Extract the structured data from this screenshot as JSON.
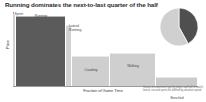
{
  "title": "Running dominates the next-to-last quarter of the half",
  "chart_data": {
    "type": "bar",
    "title": "Running dominates the next-to-last quarter of the half",
    "xlabel": "Fraction of Game Time",
    "ylabel": "Pace",
    "grid": false,
    "legend": "none",
    "categories": [
      "Sprint",
      "Running",
      "Lateral Running",
      "Crawling",
      "Walking",
      "Benched"
    ],
    "values": [
      97,
      94,
      83,
      40,
      44,
      12
    ],
    "widths": [
      3,
      50,
      6,
      38,
      46,
      30
    ],
    "ylim": [
      0,
      100
    ],
    "xlim": [
      0,
      100
    ],
    "annotations": [
      {
        "label": "Sprint",
        "value": 97
      },
      {
        "label": "Running",
        "value": 94
      },
      {
        "label": "Lateral\nRunning",
        "value": 83
      },
      {
        "label": "Crawling",
        "value": 40
      },
      {
        "label": "Walking",
        "value": 44
      },
      {
        "label": "Benched",
        "value": 12
      }
    ],
    "colors": {
      "highlight": "#5b5b5b",
      "muted": "#c9c9c9",
      "axis": "#9a9a9a",
      "text": "#3d3d3d"
    }
  },
  "bars": [
    {
      "name": "sprint",
      "label": "Sprint",
      "x": 0.0,
      "w": 3.0,
      "h": 97,
      "color": "#d2d2d2",
      "label_x": 1.5,
      "label_y": 0,
      "label_w": 14,
      "label_align": "left"
    },
    {
      "name": "running",
      "label": "Running",
      "x": 3.0,
      "w": 50.0,
      "h": 94,
      "color": "#5b5b5b",
      "label_x": 28,
      "label_y": 1.5,
      "label_w": 26,
      "label_align": "center"
    },
    {
      "name": "lateral-running",
      "label": "Lateral\nRunning",
      "x": 53.0,
      "w": 6.0,
      "h": 83,
      "color": "#d2d2d2",
      "label_x": 56,
      "label_y": 12,
      "label_w": 16,
      "label_align": "left"
    },
    {
      "name": "crawling",
      "label": "Crawling",
      "x": 59.0,
      "w": 38.0,
      "h": 40,
      "color": "#cfcfcf",
      "label_x": 78,
      "label_y": 56,
      "label_w": 24,
      "label_align": "center"
    },
    {
      "name": "walking",
      "label": "Walking",
      "x": 97.0,
      "w": 46.0,
      "h": 44,
      "color": "#cfcfcf",
      "label_x": 120,
      "label_y": 52,
      "label_w": 24,
      "label_align": "center"
    },
    {
      "name": "benched",
      "label": "Benched",
      "x": 143.0,
      "w": 42.0,
      "h": 12,
      "color": "#cbcbcb",
      "label_x": 164,
      "label_y": 84,
      "label_w": 24,
      "label_align": "center"
    }
  ],
  "axes": {
    "x_title": "Fraction of Game Time",
    "y_title": "Pace"
  },
  "pie": {
    "name": "movement-share-pie",
    "slices": [
      {
        "name": "active",
        "value": 42,
        "color": "#4f4f4f"
      },
      {
        "name": "inactive",
        "value": 58,
        "color": "#d0d0d0"
      }
    ]
  },
  "caption": "Counts of movement type by player and half of match; lateral, run and sprint are defined by absolute speed"
}
